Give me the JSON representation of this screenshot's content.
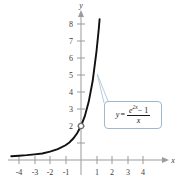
{
  "figure": {
    "name": "graph-of-exponential-difference-quotient"
  },
  "axes": {
    "x_axis_label": "x",
    "y_axis_label": "y",
    "x_tick_labels": [
      "-4",
      "-3",
      "-2",
      "-1",
      "1",
      "2",
      "3",
      "4"
    ],
    "y_tick_labels": [
      "2",
      "3",
      "4",
      "5",
      "6",
      "7",
      "8"
    ]
  },
  "callout": {
    "lhs": "y",
    "equals": "=",
    "numerator_base": "e",
    "numerator_exponent": "2x",
    "numerator_tail": "− 1",
    "denominator": "x",
    "plain_text": "y = (e^(2x) - 1) / x"
  },
  "style": {
    "curve_color": "#111111",
    "axis_color": "#9b9b9b",
    "callout_border_color": "#9fb8cd",
    "leader_line_color": "#b9cbd9",
    "hole_marker_color": "#6f6f6f",
    "background": "#ffffff"
  },
  "chart_data": {
    "type": "line",
    "title": "",
    "xlabel": "x",
    "ylabel": "y",
    "xlim": [
      -4.6,
      4.6
    ],
    "ylim": [
      -0.7,
      8.8
    ],
    "grid": false,
    "legend": "none",
    "annotations": [
      {
        "text": "y = (e^(2x) - 1) / x",
        "type": "callout-box",
        "points_to": [
          1.05,
          5.05
        ]
      }
    ],
    "markers": [
      {
        "type": "open-circle",
        "x": 0,
        "y": 2,
        "label": "removable discontinuity at x = 0"
      }
    ],
    "series": [
      {
        "name": "y = (e^(2x) - 1)/x",
        "x": [
          -4.5,
          -4.0,
          -3.5,
          -3.0,
          -2.5,
          -2.0,
          -1.5,
          -1.0,
          -0.75,
          -0.5,
          -0.25,
          0,
          0.25,
          0.5,
          0.75,
          1.0,
          1.15,
          1.2
        ],
        "y": [
          0.222,
          0.25,
          0.286,
          0.333,
          0.381,
          0.491,
          0.634,
          0.865,
          1.035,
          1.264,
          1.573,
          2.0,
          2.595,
          3.437,
          4.63,
          6.389,
          7.737,
          8.285
        ]
      }
    ]
  }
}
